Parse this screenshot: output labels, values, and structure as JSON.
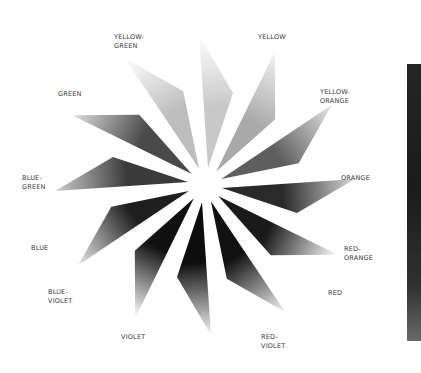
{
  "diagram": {
    "type": "color-wheel",
    "center": [
      205,
      185
    ],
    "segments": [
      {
        "name": "yellow",
        "label": "YELLOW",
        "angle": 15,
        "light": "#ffffff",
        "dark": "#c8c8c8"
      },
      {
        "name": "yellow-orange",
        "label": "YELLOW-\nORANGE",
        "angle": 45,
        "light": "#f2f2f2",
        "dark": "#a9a9a9"
      },
      {
        "name": "orange",
        "label": "ORANGE",
        "angle": 75,
        "light": "#e6e6e6",
        "dark": "#5e5e5e"
      },
      {
        "name": "red-orange",
        "label": "RED-\nORANGE",
        "angle": 105,
        "light": "#d9d9d9",
        "dark": "#2a2a2a"
      },
      {
        "name": "red",
        "label": "RED",
        "angle": 135,
        "light": "#ffffff",
        "dark": "#1a1a1a"
      },
      {
        "name": "red-violet",
        "label": "RED-\nVIOLET",
        "angle": 165,
        "light": "#f5f5f5",
        "dark": "#111111"
      },
      {
        "name": "violet",
        "label": "VIOLET",
        "angle": 195,
        "light": "#f5f5f5",
        "dark": "#0d0d0d"
      },
      {
        "name": "blue-violet",
        "label": "BLUE-\nVIOLET",
        "angle": 225,
        "light": "#ffffff",
        "dark": "#101010"
      },
      {
        "name": "blue",
        "label": "BLUE",
        "angle": 255,
        "light": "#e8e8e8",
        "dark": "#1e1e1e"
      },
      {
        "name": "blue-green",
        "label": "BLUE-\nGREEN",
        "angle": 285,
        "light": "#cfcfcf",
        "dark": "#3a3a3a"
      },
      {
        "name": "green",
        "label": "GREEN",
        "angle": 315,
        "light": "#dedede",
        "dark": "#4a4a4a"
      },
      {
        "name": "yellow-green",
        "label": "YELLOW-\nGREEN",
        "angle": 345,
        "light": "#ffffff",
        "dark": "#bdbdbd"
      }
    ],
    "labels": [
      {
        "key": "yellow",
        "text": "YELLOW",
        "x": 258,
        "y": 33
      },
      {
        "key": "yellow-orange",
        "text": "YELLOW-\nORANGE",
        "x": 320,
        "y": 88
      },
      {
        "key": "orange",
        "text": "ORANGE",
        "x": 341,
        "y": 174
      },
      {
        "key": "red-orange",
        "text": "RED-\nORANGE",
        "x": 344,
        "y": 245
      },
      {
        "key": "red",
        "text": "RED",
        "x": 328,
        "y": 289
      },
      {
        "key": "red-violet",
        "text": "RED-\nVIOLET",
        "x": 261,
        "y": 333
      },
      {
        "key": "violet",
        "text": "VIOLET",
        "x": 121,
        "y": 333
      },
      {
        "key": "blue-violet",
        "text": "BLUE-\nVIOLET",
        "x": 48,
        "y": 288
      },
      {
        "key": "blue",
        "text": "BLUE",
        "x": 31,
        "y": 244
      },
      {
        "key": "blue-green",
        "text": "BLUE-\nGREEN",
        "x": 22,
        "y": 174
      },
      {
        "key": "green",
        "text": "GREEN",
        "x": 58,
        "y": 90
      },
      {
        "key": "yellow-green",
        "text": "YELLOW-\nGREEN",
        "x": 114,
        "y": 33
      }
    ]
  }
}
